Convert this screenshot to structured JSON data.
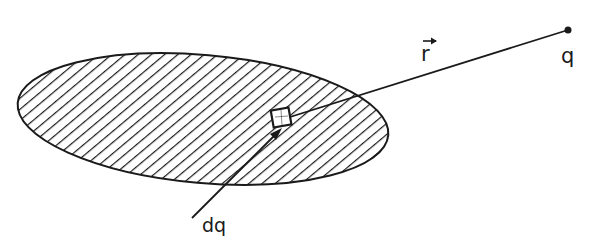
{
  "diagram": {
    "labels": {
      "position_vector": "r",
      "point_charge": "q",
      "charge_element": "dq"
    },
    "colors": {
      "ink": "#1a1a1a",
      "background": "#ffffff"
    }
  }
}
